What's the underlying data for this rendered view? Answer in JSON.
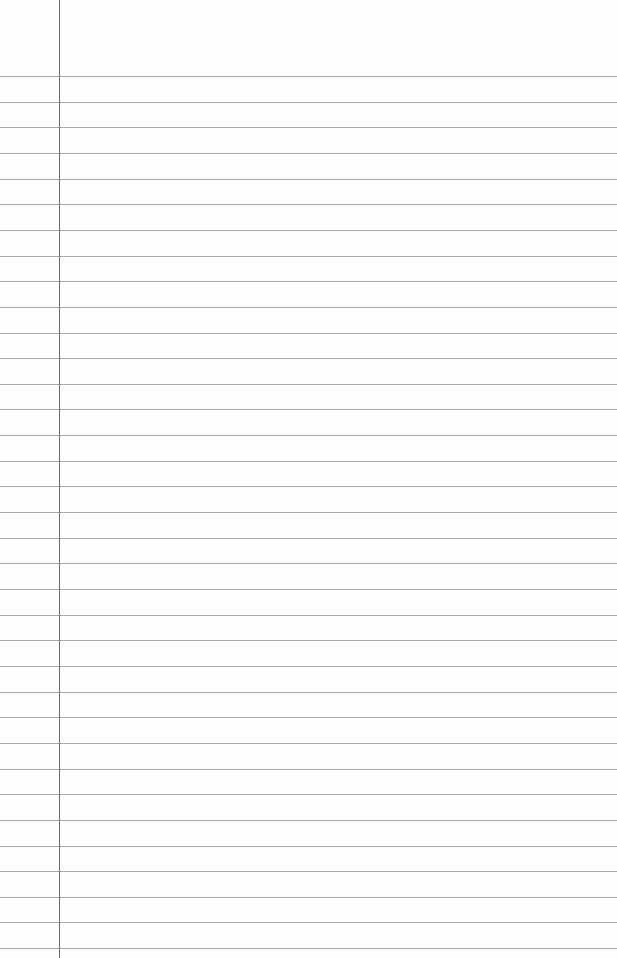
{
  "paper": {
    "type": "lined-paper",
    "background": "#fefefe",
    "rule_color": "#9a9a9a",
    "margin_color": "#6e6e6e",
    "margin_x": 59,
    "first_rule_y": 76,
    "rule_spacing": 25.65,
    "rule_count": 35
  }
}
